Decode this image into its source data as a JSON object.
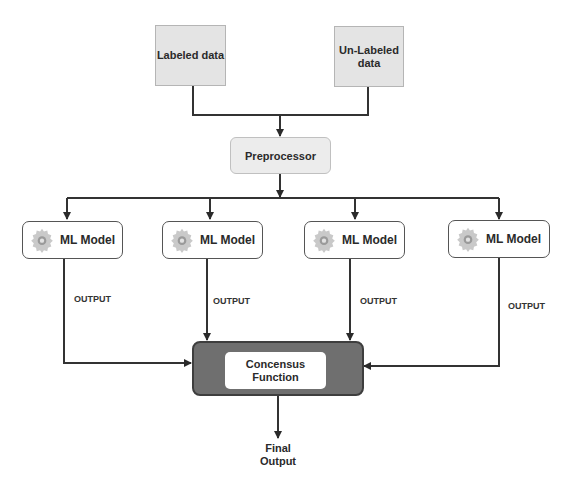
{
  "inputs": {
    "labeled": "Labeled data",
    "unlabeled_line1": "Un-Labeled",
    "unlabeled_line2": "data"
  },
  "preprocessor": {
    "label": "Preprocessor"
  },
  "models": [
    {
      "label": "ML Model",
      "icon": "gear-icon",
      "output_label": "OUTPUT"
    },
    {
      "label": "ML Model",
      "icon": "gear-icon",
      "output_label": "OUTPUT"
    },
    {
      "label": "ML Model",
      "icon": "gear-icon",
      "output_label": "OUTPUT"
    },
    {
      "label": "ML Model",
      "icon": "gear-icon",
      "output_label": "OUTPUT"
    }
  ],
  "consensus": {
    "line1": "Concensus",
    "line2": "Function"
  },
  "final_output": {
    "line1": "Final",
    "line2": "Output"
  },
  "colors": {
    "input_fill": "#e4e4e4",
    "consensus_fill": "#6f6f6f",
    "edge": "#333333"
  }
}
